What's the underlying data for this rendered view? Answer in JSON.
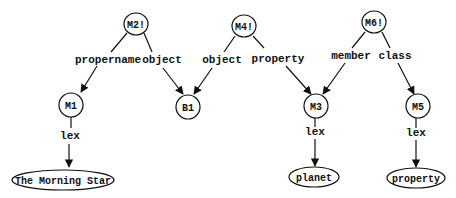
{
  "nodes": {
    "m2": {
      "label": "M2!"
    },
    "m4": {
      "label": "M4!"
    },
    "m6": {
      "label": "M6!"
    },
    "m1": {
      "label": "M1"
    },
    "b1": {
      "label": "B1"
    },
    "m3": {
      "label": "M3"
    },
    "m5": {
      "label": "M5"
    },
    "morning_star": {
      "label": "The Morning Star"
    },
    "planet": {
      "label": "planet"
    },
    "property": {
      "label": "property"
    }
  },
  "edges": {
    "m2_m1": {
      "label": "propername"
    },
    "m2_b1": {
      "label": "object"
    },
    "m4_b1": {
      "label": "object"
    },
    "m4_m3": {
      "label": "property"
    },
    "m6_m3": {
      "label": "member"
    },
    "m6_m5": {
      "label": "class"
    },
    "m1_lex": {
      "label": "lex"
    },
    "m3_lex": {
      "label": "lex"
    },
    "m5_lex": {
      "label": "lex"
    }
  }
}
